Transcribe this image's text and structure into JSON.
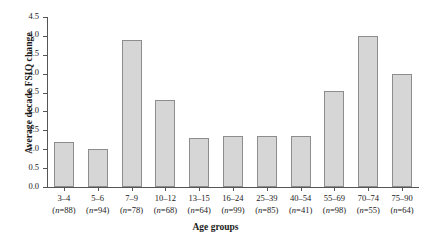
{
  "chart_data": {
    "type": "bar",
    "title": "",
    "xlabel": "Age groups",
    "ylabel": "Average decade FSIQ change",
    "ylim": [
      0.0,
      4.5
    ],
    "ytick_step": 0.5,
    "grid": false,
    "legend": "none",
    "bar_fill_color": "#d6d6d6",
    "bar_border_color": "#8d8d8d",
    "axis_color": "#555555",
    "ytick_labels": [
      "0.0",
      "0.5",
      "1.0",
      "1.5",
      "2.0",
      "2.5",
      "3.0",
      "3.5",
      "4.0",
      "4.5"
    ],
    "ytick_values": [
      0.0,
      0.5,
      1.0,
      1.5,
      2.0,
      2.5,
      3.0,
      3.5,
      4.0,
      4.5
    ],
    "categories": [
      "3–4",
      "5–6",
      "7–9",
      "10–12",
      "13–15",
      "16–24",
      "25–39",
      "40–54",
      "55–69",
      "70–74",
      "75–90"
    ],
    "category_counts": [
      "(n=88)",
      "(n=94)",
      "(n=78)",
      "(n=68)",
      "(n=64)",
      "(n=99)",
      "(n=85)",
      "(n=41)",
      "(n=98)",
      "(n=55)",
      "(n=64)"
    ],
    "values": [
      1.2,
      1.0,
      3.9,
      2.3,
      1.3,
      1.35,
      1.35,
      1.35,
      2.55,
      4.0,
      3.0
    ],
    "bars": [
      {
        "category": "3–4",
        "count": "(n=88)",
        "n": 88,
        "value": 1.2
      },
      {
        "category": "5–6",
        "count": "(n=94)",
        "n": 94,
        "value": 1.0
      },
      {
        "category": "7–9",
        "count": "(n=78)",
        "n": 78,
        "value": 3.9
      },
      {
        "category": "10–12",
        "count": "(n=68)",
        "n": 68,
        "value": 2.3
      },
      {
        "category": "13–15",
        "count": "(n=64)",
        "n": 64,
        "value": 1.3
      },
      {
        "category": "16–24",
        "count": "(n=99)",
        "n": 99,
        "value": 1.35
      },
      {
        "category": "25–39",
        "count": "(n=85)",
        "n": 85,
        "value": 1.35
      },
      {
        "category": "40–54",
        "count": "(n=41)",
        "n": 41,
        "value": 1.35
      },
      {
        "category": "55–69",
        "count": "(n=98)",
        "n": 98,
        "value": 2.55
      },
      {
        "category": "70–74",
        "count": "(n=55)",
        "n": 55,
        "value": 4.0
      },
      {
        "category": "75–90",
        "count": "(n=64)",
        "n": 64,
        "value": 3.0
      }
    ]
  }
}
